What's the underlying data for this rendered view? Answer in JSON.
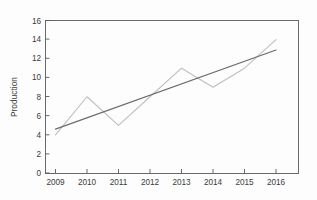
{
  "chart_data": {
    "type": "line",
    "title": "",
    "xlabel": "",
    "ylabel": "Production",
    "x": [
      2009,
      2010,
      2011,
      2012,
      2013,
      2014,
      2015,
      2016
    ],
    "xtick_labels": [
      "2009",
      "2010",
      "2011",
      "2012",
      "2013",
      "2014",
      "2015",
      "2016"
    ],
    "ytick_labels": [
      "0",
      "2",
      "4",
      "6",
      "8",
      "10",
      "12",
      "14",
      "16"
    ],
    "yticks": [
      0,
      2,
      4,
      6,
      8,
      10,
      12,
      14,
      16
    ],
    "ylim": [
      0,
      16
    ],
    "xlim": [
      2009,
      2016
    ],
    "grid": false,
    "legend": "none",
    "series": [
      {
        "name": "Production",
        "kind": "data",
        "color": "#bfbfbf",
        "values": [
          4,
          8,
          5,
          8,
          11,
          9,
          11,
          14
        ]
      },
      {
        "name": "Linear trend",
        "kind": "trendline",
        "color": "#6b6b6b",
        "values": [
          4.6,
          5.79,
          6.97,
          8.16,
          9.34,
          10.53,
          11.71,
          12.9
        ]
      }
    ]
  },
  "axes": {
    "y_axis_title": "Production"
  },
  "background": {
    "bleed_through_text": "faint reverse-side print visible through the paper, illegible"
  }
}
